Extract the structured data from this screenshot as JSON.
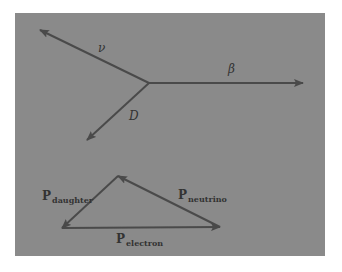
{
  "colors": {
    "background": "#ffffff",
    "panel": "#8a8a8a",
    "stroke": "#4a4a4a",
    "text": "#333333"
  },
  "decay_diagram": {
    "vertex": [
      149,
      83
    ],
    "arrows": [
      {
        "name": "neutrino",
        "label": "ν",
        "from": [
          149,
          83
        ],
        "to": [
          40,
          30
        ]
      },
      {
        "name": "beta",
        "label": "β",
        "from": [
          149,
          83
        ],
        "to": [
          303,
          83
        ]
      },
      {
        "name": "daughter",
        "label": "D",
        "from": [
          149,
          83
        ],
        "to": [
          87,
          140
        ]
      }
    ]
  },
  "momentum_triangle": {
    "vertices": {
      "top": [
        118,
        176
      ],
      "left": [
        62,
        228
      ],
      "right": [
        220,
        227
      ]
    },
    "vectors": [
      {
        "name": "daughter",
        "label_main": "P",
        "label_sub": "daughter",
        "from": [
          118,
          176
        ],
        "to": [
          62,
          228
        ]
      },
      {
        "name": "electron",
        "label_main": "P",
        "label_sub": "electron",
        "from": [
          62,
          228
        ],
        "to": [
          220,
          227
        ]
      },
      {
        "name": "neutrino",
        "label_main": "P",
        "label_sub": "neutrino",
        "from": [
          220,
          227
        ],
        "to": [
          118,
          176
        ]
      }
    ]
  },
  "labels": {
    "nu": "ν",
    "beta": "β",
    "D": "D",
    "p_main": "P",
    "p_daughter_sub": "daughter",
    "p_electron_sub": "electron",
    "p_neutrino_sub": "neutrino"
  }
}
